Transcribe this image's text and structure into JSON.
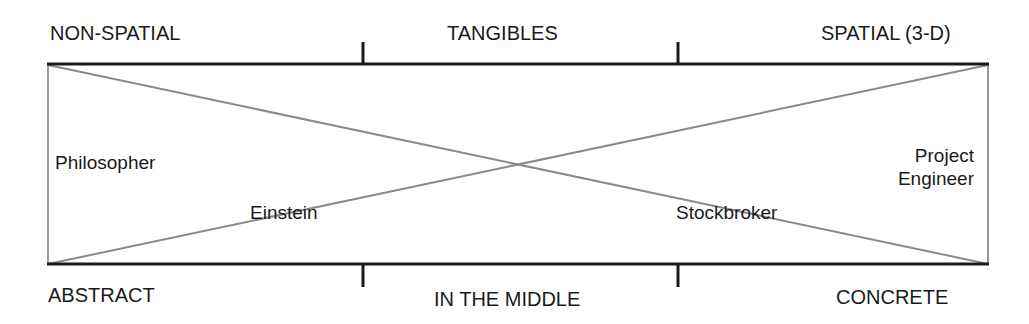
{
  "top_axis": {
    "left": "NON-SPATIAL",
    "middle": "TANGIBLES",
    "right": "SPATIAL (3-D)"
  },
  "bottom_axis": {
    "left": "ABSTRACT",
    "middle": "IN THE MIDDLE",
    "right": "CONCRETE"
  },
  "roles": {
    "philosopher": "Philosopher",
    "einstein": "Einstein",
    "stockbroker": "Stockbroker",
    "project_engineer_line1": "Project",
    "project_engineer_line2": "Engineer"
  },
  "colors": {
    "axis": "#1a1a1a",
    "diagonal": "#888888"
  }
}
